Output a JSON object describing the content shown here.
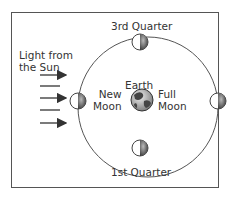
{
  "diagram": {
    "light_label_line1": "Light from",
    "light_label_line2": "the Sun",
    "center_label": "Earth",
    "phases": {
      "third_quarter": "3rd Quarter",
      "first_quarter": "1st Quarter",
      "new_moon_line1": "New",
      "new_moon_line2": "Moon",
      "full_moon_line1": "Full",
      "full_moon_line2": "Moon"
    },
    "colors": {
      "line": "#555555",
      "text": "#333333",
      "moon_dark": "#444444",
      "moon_light": "#ffffff"
    }
  }
}
